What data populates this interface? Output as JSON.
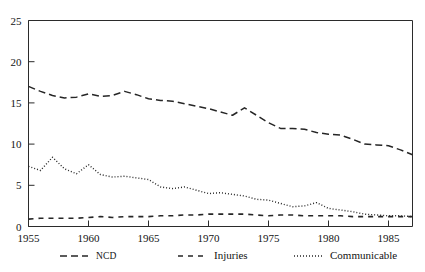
{
  "chart_data": {
    "type": "line",
    "title": "",
    "xlabel": "",
    "ylabel": "",
    "xlim": [
      1955,
      1987
    ],
    "ylim": [
      0,
      25
    ],
    "xticks": [
      1955,
      1960,
      1965,
      1970,
      1975,
      1980,
      1985
    ],
    "yticks": [
      0,
      5,
      10,
      15,
      20,
      25
    ],
    "grid": false,
    "legend_position": "bottom",
    "x": [
      1955,
      1956,
      1957,
      1958,
      1959,
      1960,
      1961,
      1962,
      1963,
      1964,
      1965,
      1966,
      1967,
      1968,
      1969,
      1970,
      1971,
      1972,
      1973,
      1974,
      1975,
      1976,
      1977,
      1978,
      1979,
      1980,
      1981,
      1982,
      1983,
      1984,
      1985,
      1986,
      1987
    ],
    "series": [
      {
        "name": "NCD",
        "style": "dashed",
        "values": [
          17.0,
          16.4,
          15.9,
          15.6,
          15.7,
          16.1,
          15.8,
          15.9,
          16.4,
          16.0,
          15.5,
          15.3,
          15.2,
          14.9,
          14.6,
          14.3,
          13.9,
          13.5,
          14.4,
          13.5,
          12.6,
          11.9,
          11.9,
          11.8,
          11.4,
          11.2,
          11.1,
          10.6,
          10.0,
          9.9,
          9.8,
          9.3,
          8.7
        ]
      },
      {
        "name": "Injuries",
        "style": "long-dashed",
        "values": [
          0.9,
          1.0,
          1.0,
          1.0,
          1.0,
          1.1,
          1.2,
          1.1,
          1.2,
          1.2,
          1.2,
          1.3,
          1.3,
          1.4,
          1.4,
          1.5,
          1.5,
          1.5,
          1.5,
          1.4,
          1.3,
          1.4,
          1.4,
          1.3,
          1.3,
          1.3,
          1.3,
          1.2,
          1.2,
          1.2,
          1.2,
          1.2,
          1.2
        ]
      },
      {
        "name": "Communicable",
        "style": "dotted",
        "values": [
          7.3,
          6.8,
          8.4,
          7.0,
          6.4,
          7.5,
          6.3,
          6.0,
          6.1,
          5.9,
          5.7,
          4.8,
          4.6,
          4.8,
          4.4,
          4.0,
          4.1,
          3.9,
          3.7,
          3.3,
          3.2,
          2.8,
          2.4,
          2.5,
          2.9,
          2.2,
          2.0,
          1.8,
          1.5,
          1.4,
          1.3,
          1.3,
          1.2
        ]
      }
    ],
    "legend": [
      {
        "label": "NCD",
        "style": "dashed"
      },
      {
        "label": "Injuries",
        "style": "long-dashed"
      },
      {
        "label": "Communicable",
        "style": "dotted"
      }
    ]
  }
}
